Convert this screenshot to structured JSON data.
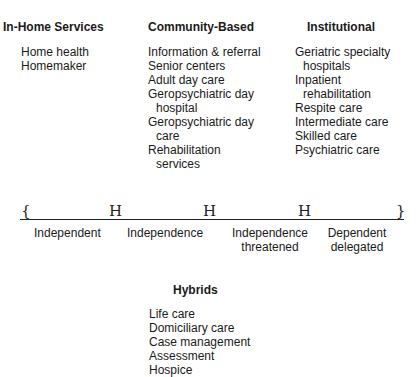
{
  "columns": {
    "in_home": {
      "title": "In-Home Services",
      "items": [
        "Home health",
        "Homemaker"
      ]
    },
    "community": {
      "title": "Community-Based",
      "items": [
        "Information & referral",
        "Senior centers",
        "Adult day care",
        "Geropsychiatric day",
        "hospital",
        "Geropsychiatric day",
        "care",
        "Rehabilitation",
        "services"
      ]
    },
    "institutional": {
      "title": "Institutional",
      "items": [
        "Geriatric specialty",
        "hospitals",
        "Inpatient",
        "rehabilitation",
        "Respite care",
        "Intermediate care",
        "Skilled care",
        "Psychiatric care"
      ]
    }
  },
  "continuum": {
    "marks": [
      "{",
      "H",
      "H",
      "H",
      "}"
    ],
    "segments": [
      {
        "label": "Independent"
      },
      {
        "label": "Independence"
      },
      {
        "label_1": "Independence",
        "label_2": "threatened"
      },
      {
        "label_1": "Dependent",
        "label_2": "delegated"
      }
    ]
  },
  "hybrids": {
    "title": "Hybrids",
    "items": [
      "Life care",
      "Domiciliary care",
      "Case management",
      "Assessment",
      "Hospice"
    ]
  }
}
